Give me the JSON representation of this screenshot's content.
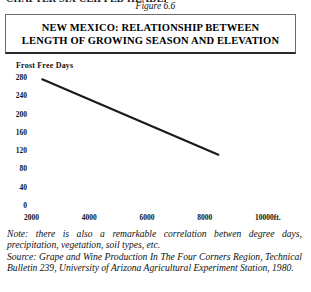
{
  "running_head": "CHAPTER SIX CLIPPED HEADER",
  "figure_caption": "Figure 6.6",
  "title": {
    "line1": "NEW MEXICO: RELATIONSHIP BETWEEN",
    "line2": "LENGTH OF GROWING SEASON AND ELEVATION"
  },
  "chart_data": {
    "type": "line",
    "title": "NEW MEXICO: RELATIONSHIP BETWEEN LENGTH OF GROWING SEASON AND ELEVATION",
    "xlabel": "",
    "ylabel": "Frost Free Days",
    "x_unit_label": "10000ft.",
    "xlim": [
      1000,
      10600
    ],
    "ylim": [
      0,
      290
    ],
    "xticks": [
      2000,
      4000,
      6000,
      8000,
      10000
    ],
    "xtick_labels": [
      "2000",
      "4000",
      "6000",
      "8000",
      "10000ft."
    ],
    "yticks": [
      0,
      40,
      80,
      120,
      160,
      200,
      240,
      280
    ],
    "ytick_labels": [
      "0",
      "40",
      "80",
      "120",
      "160",
      "200",
      "240",
      "280"
    ],
    "grid": false,
    "axis_lines": false,
    "legend": null,
    "series": [
      {
        "name": "Frost free days vs elevation",
        "color": "#1a1a1a",
        "x": [
          2250,
          8350
        ],
        "y": [
          275,
          110
        ]
      }
    ]
  },
  "note": {
    "label": "Note:",
    "text": "Note: there is also a remarkable correlation betwen degree days, precipitation, vegetation, soil types, etc."
  },
  "source": {
    "label": "Source:",
    "text": "Source: Grape and Wine Production In The Four Corners Region, Technical Bulletin 239, University of Arizona Agricultural Experiment Station, 1980."
  }
}
